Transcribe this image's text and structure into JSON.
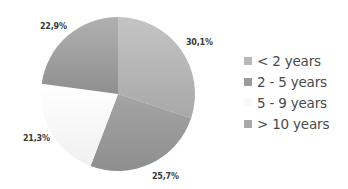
{
  "chart_data": {
    "type": "pie",
    "title": "",
    "categories": [
      "< 2 years",
      "2 - 5 years",
      "5 - 9 years",
      "> 10 years"
    ],
    "values": [
      30.1,
      25.7,
      21.3,
      22.9
    ],
    "value_labels": [
      "30,1%",
      "25,7%",
      "21,3%",
      "22,9%"
    ],
    "colors": [
      "#b4b4b4",
      "#9a9a9a",
      "#f7f7f7",
      "#a6a6a6"
    ],
    "start_angle": "12 o'clock",
    "direction": "clockwise",
    "legend_position": "right"
  },
  "legend": {
    "items": [
      {
        "label": "< 2 years",
        "color": "#b9b9b9"
      },
      {
        "label": "2 - 5 years",
        "color": "#9c9c9c"
      },
      {
        "label": "5 - 9 years",
        "color": "#f7f7f7"
      },
      {
        "label": "> 10 years",
        "color": "#a9a9a9"
      }
    ]
  }
}
